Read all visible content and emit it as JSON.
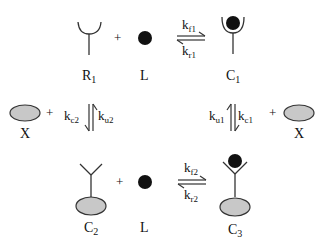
{
  "diagram": {
    "type": "reaction-scheme",
    "colors": {
      "ligand": "#111111",
      "membrane_protein": "#c8c8c8",
      "stroke": "#333333",
      "background": "#ffffff"
    },
    "species": {
      "R1": {
        "main": "R",
        "sub": "1"
      },
      "L_top": {
        "main": "L"
      },
      "C1": {
        "main": "C",
        "sub": "1"
      },
      "X_left": {
        "main": "X"
      },
      "X_right": {
        "main": "X"
      },
      "C2": {
        "main": "C",
        "sub": "2"
      },
      "L_bottom": {
        "main": "L"
      },
      "C3": {
        "main": "C",
        "sub": "3"
      }
    },
    "plus_sign": "+",
    "rates": {
      "kf1": {
        "main": "k",
        "sub": "f1"
      },
      "kr1": {
        "main": "k",
        "sub": "r1"
      },
      "kc2": {
        "main": "k",
        "sub": "c2"
      },
      "ku2": {
        "main": "k",
        "sub": "u2"
      },
      "ku1": {
        "main": "k",
        "sub": "u1"
      },
      "kc1": {
        "main": "k",
        "sub": "c1"
      },
      "kf2": {
        "main": "k",
        "sub": "f2"
      },
      "kr2": {
        "main": "k",
        "sub": "r2"
      }
    },
    "reactions": [
      {
        "name": "top",
        "left": [
          "R1",
          "L"
        ],
        "right": [
          "C1"
        ],
        "forward": "kf1",
        "reverse": "kr1"
      },
      {
        "name": "left-vertical",
        "from": "R1 + X",
        "to": "C2",
        "forward": "kc2",
        "reverse": "ku2"
      },
      {
        "name": "right-vertical",
        "from": "C1 + X",
        "to": "C3",
        "forward": "kc1",
        "reverse": "ku1"
      },
      {
        "name": "bottom",
        "left": [
          "C2",
          "L"
        ],
        "right": [
          "C3"
        ],
        "forward": "kf2",
        "reverse": "kr2"
      }
    ]
  }
}
